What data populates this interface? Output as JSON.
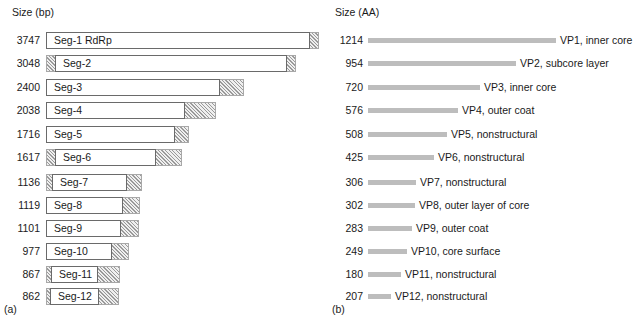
{
  "panel_a": {
    "caption": "(a)",
    "axis_title": "Size (bp)",
    "unit": "bp",
    "rows": [
      {
        "size": "3747",
        "name": "Seg-1 RdRp",
        "total_px": 273,
        "utr_left_px": 0,
        "utr_right_px": 9
      },
      {
        "size": "3048",
        "name": "Seg-2",
        "total_px": 250,
        "utr_left_px": 9,
        "utr_right_px": 9
      },
      {
        "size": "2400",
        "name": "Seg-3",
        "total_px": 198,
        "utr_left_px": 0,
        "utr_right_px": 24
      },
      {
        "size": "2038",
        "name": "Seg-4",
        "total_px": 170,
        "utr_left_px": 0,
        "utr_right_px": 31
      },
      {
        "size": "1716",
        "name": "Seg-5",
        "total_px": 143,
        "utr_left_px": 0,
        "utr_right_px": 14
      },
      {
        "size": "1617",
        "name": "Seg-6",
        "total_px": 136,
        "utr_left_px": 9,
        "utr_right_px": 26
      },
      {
        "size": "1136",
        "name": "Seg-7",
        "total_px": 96,
        "utr_left_px": 6,
        "utr_right_px": 15
      },
      {
        "size": "1119",
        "name": "Seg-8",
        "total_px": 94,
        "utr_left_px": 0,
        "utr_right_px": 17
      },
      {
        "size": "1101",
        "name": "Seg-9",
        "total_px": 93,
        "utr_left_px": 0,
        "utr_right_px": 18
      },
      {
        "size": "977",
        "name": "Seg-10",
        "total_px": 83,
        "utr_left_px": 0,
        "utr_right_px": 17
      },
      {
        "size": "867",
        "name": "Seg-11",
        "total_px": 74,
        "utr_left_px": 5,
        "utr_right_px": 22
      },
      {
        "size": "862",
        "name": "Seg-12",
        "total_px": 73,
        "utr_left_px": 4,
        "utr_right_px": 20
      }
    ]
  },
  "panel_b": {
    "caption": "(b)",
    "axis_title": "Size (AA)",
    "unit": "AA",
    "rows": [
      {
        "size": "1214",
        "label": "VP1, inner core",
        "bar_px": 188
      },
      {
        "size": "954",
        "label": "VP2, subcore layer",
        "bar_px": 148
      },
      {
        "size": "720",
        "label": "VP3, inner core",
        "bar_px": 112
      },
      {
        "size": "576",
        "label": "VP4, outer coat",
        "bar_px": 90
      },
      {
        "size": "508",
        "label": "VP5, nonstructural",
        "bar_px": 79
      },
      {
        "size": "425",
        "label": "VP6, nonstructural",
        "bar_px": 66
      },
      {
        "size": "306",
        "label": "VP7, nonstructural",
        "bar_px": 48
      },
      {
        "size": "302",
        "label": "VP8, outer layer of core",
        "bar_px": 47
      },
      {
        "size": "283",
        "label": "VP9, outer coat",
        "bar_px": 44
      },
      {
        "size": "249",
        "label": "VP10, core surface",
        "bar_px": 39
      },
      {
        "size": "180",
        "label": "VP11, nonstructural",
        "bar_px": 33
      },
      {
        "size": "207",
        "label": "VP12, nonstructural",
        "bar_px": 23
      }
    ]
  },
  "layout": {
    "row_tops_a": [
      30,
      53,
      77,
      100,
      124,
      147,
      172,
      195,
      218,
      241,
      264,
      286
    ],
    "row_tops_b": [
      30,
      53,
      77,
      100,
      124,
      147,
      172,
      195,
      218,
      241,
      264,
      286
    ]
  },
  "colors": {
    "bar_gray": "#bdbdbd",
    "hatch_line": "#9a9a9a",
    "orf_border": "#6a6a6a",
    "utr_fill": "#efefef",
    "text": "#1a1a1a",
    "background": "#ffffff"
  }
}
